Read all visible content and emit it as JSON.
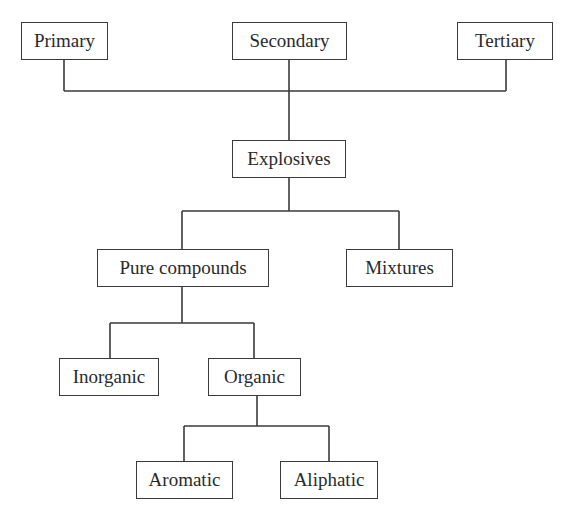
{
  "diagram": {
    "type": "tree",
    "colors": {
      "stroke": "#3a3a3a",
      "text": "#2a2a2a",
      "background": "#ffffff"
    },
    "nodes": {
      "primary": {
        "label": "Primary",
        "x": 21,
        "y": 22,
        "w": 87,
        "h": 38
      },
      "secondary": {
        "label": "Secondary",
        "x": 232,
        "y": 22,
        "w": 115,
        "h": 38
      },
      "tertiary": {
        "label": "Tertiary",
        "x": 457,
        "y": 22,
        "w": 96,
        "h": 38
      },
      "explosives": {
        "label": "Explosives",
        "x": 232,
        "y": 140,
        "w": 114,
        "h": 38
      },
      "pure": {
        "label": "Pure compounds",
        "x": 97,
        "y": 249,
        "w": 172,
        "h": 38
      },
      "mixtures": {
        "label": "Mixtures",
        "x": 346,
        "y": 249,
        "w": 107,
        "h": 38
      },
      "inorganic": {
        "label": "Inorganic",
        "x": 59,
        "y": 358,
        "w": 100,
        "h": 38
      },
      "organic": {
        "label": "Organic",
        "x": 208,
        "y": 358,
        "w": 93,
        "h": 38
      },
      "aromatic": {
        "label": "Aromatic",
        "x": 136,
        "y": 461,
        "w": 97,
        "h": 38
      },
      "aliphatic": {
        "label": "Aliphatic",
        "x": 280,
        "y": 461,
        "w": 98,
        "h": 38
      }
    },
    "edges": [
      {
        "from": [
          "primary",
          "secondary",
          "tertiary"
        ],
        "to": "explosives"
      },
      {
        "from": "explosives",
        "to": [
          "pure",
          "mixtures"
        ]
      },
      {
        "from": "pure",
        "to": [
          "inorganic",
          "organic"
        ]
      },
      {
        "from": "organic",
        "to": [
          "aromatic",
          "aliphatic"
        ]
      }
    ],
    "lines": [
      [
        64,
        60,
        64,
        91
      ],
      [
        289,
        60,
        289,
        140
      ],
      [
        506,
        60,
        506,
        91
      ],
      [
        64,
        91,
        506,
        91
      ],
      [
        289,
        178,
        289,
        211
      ],
      [
        182,
        211,
        399,
        211
      ],
      [
        182,
        211,
        182,
        249
      ],
      [
        399,
        211,
        399,
        249
      ],
      [
        182,
        287,
        182,
        323
      ],
      [
        110,
        323,
        254,
        323
      ],
      [
        110,
        323,
        110,
        358
      ],
      [
        254,
        323,
        254,
        358
      ],
      [
        257,
        396,
        257,
        426
      ],
      [
        184,
        426,
        329,
        426
      ],
      [
        184,
        426,
        184,
        461
      ],
      [
        329,
        426,
        329,
        461
      ]
    ]
  }
}
